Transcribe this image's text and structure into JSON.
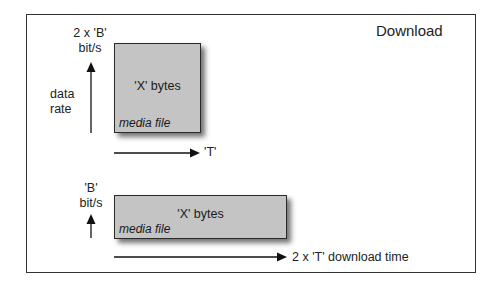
{
  "title": "Download",
  "top_scenario": {
    "rate_label_line1": "2 x 'B'",
    "rate_label_line2": "bit/s",
    "axis_label_line1": "data",
    "axis_label_line2": "rate",
    "box_text": "'X' bytes",
    "box_caption": "media file",
    "time_label": "'T'"
  },
  "bottom_scenario": {
    "rate_label_line1": "'B'",
    "rate_label_line2": "bit/s",
    "box_text": "'X' bytes",
    "box_caption": "media file",
    "time_label": "2 x 'T' download time"
  },
  "colors": {
    "box_fill": "#c4c4c4",
    "box_border": "#2a2a2a",
    "frame_border": "#333333",
    "arrow": "#111111"
  }
}
